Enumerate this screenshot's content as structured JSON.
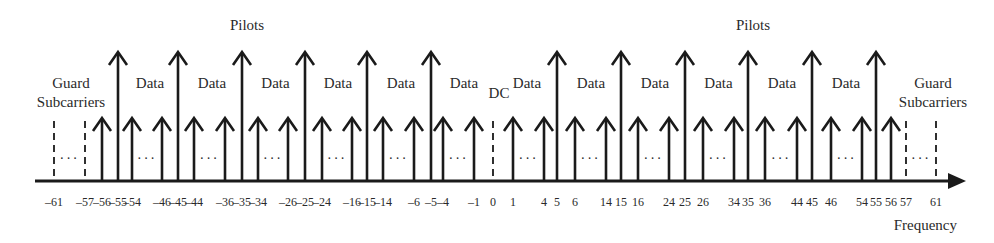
{
  "diagram": {
    "type": "ofdm-subcarrier-allocation",
    "axis_label": "Frequency",
    "labels": {
      "pilots": "Pilots",
      "data": "Data",
      "dc": "DC",
      "guard_line1": "Guard",
      "guard_line2": "Subcarriers",
      "ellipsis": "···"
    },
    "pilot_subcarriers": [
      -55,
      -45,
      -35,
      -25,
      -15,
      -5,
      5,
      15,
      25,
      35,
      45,
      55
    ],
    "data_subcarriers_shown": [
      -56,
      -54,
      -46,
      -44,
      -36,
      -34,
      -26,
      -24,
      -16,
      -14,
      -6,
      -4,
      -1,
      1,
      4,
      6,
      14,
      16,
      24,
      26,
      34,
      36,
      44,
      46,
      54,
      56
    ],
    "dashed_subcarriers": [
      -61,
      -57,
      0,
      57,
      61
    ],
    "tick_labels": [
      {
        "k": -61,
        "text": "–61"
      },
      {
        "k": -57,
        "text": "–57"
      },
      {
        "k": -56,
        "text": "–56"
      },
      {
        "k": -55,
        "text": "–55"
      },
      {
        "k": -54,
        "text": "–54"
      },
      {
        "k": -46,
        "text": "–46"
      },
      {
        "k": -45,
        "text": "–45"
      },
      {
        "k": -44,
        "text": "–44"
      },
      {
        "k": -36,
        "text": "–36"
      },
      {
        "k": -35,
        "text": "–35"
      },
      {
        "k": -34,
        "text": "–34"
      },
      {
        "k": -26,
        "text": "–26"
      },
      {
        "k": -25,
        "text": "–25"
      },
      {
        "k": -24,
        "text": "–24"
      },
      {
        "k": -16,
        "text": "–16"
      },
      {
        "k": -15,
        "text": "–15"
      },
      {
        "k": -14,
        "text": "–14"
      },
      {
        "k": -6,
        "text": "–6"
      },
      {
        "k": -5,
        "text": "–5"
      },
      {
        "k": -4,
        "text": "–4"
      },
      {
        "k": -1,
        "text": "–1"
      },
      {
        "k": 0,
        "text": "0"
      },
      {
        "k": 1,
        "text": "1"
      },
      {
        "k": 4,
        "text": "4"
      },
      {
        "k": 5,
        "text": "5"
      },
      {
        "k": 6,
        "text": "6"
      },
      {
        "k": 14,
        "text": "14"
      },
      {
        "k": 15,
        "text": "15"
      },
      {
        "k": 16,
        "text": "16"
      },
      {
        "k": 24,
        "text": "24"
      },
      {
        "k": 25,
        "text": "25"
      },
      {
        "k": 26,
        "text": "26"
      },
      {
        "k": 34,
        "text": "34"
      },
      {
        "k": 35,
        "text": "35"
      },
      {
        "k": 36,
        "text": "36"
      },
      {
        "k": 44,
        "text": "44"
      },
      {
        "k": 45,
        "text": "45"
      },
      {
        "k": 46,
        "text": "46"
      },
      {
        "k": 54,
        "text": "54"
      },
      {
        "k": 55,
        "text": "55"
      },
      {
        "k": 56,
        "text": "56"
      },
      {
        "k": 57,
        "text": "57"
      },
      {
        "k": 61,
        "text": "61"
      }
    ],
    "ellipsis_gaps": [
      [
        -61,
        -57
      ],
      [
        -54,
        -46
      ],
      [
        -44,
        -36
      ],
      [
        -34,
        -26
      ],
      [
        -24,
        -16
      ],
      [
        -14,
        -6
      ],
      [
        -4,
        -1
      ],
      [
        1,
        4
      ],
      [
        6,
        14
      ],
      [
        16,
        24
      ],
      [
        26,
        34
      ],
      [
        36,
        44
      ],
      [
        46,
        54
      ],
      [
        57,
        61
      ]
    ],
    "data_region_labels_between": [
      [
        -55,
        -45
      ],
      [
        -45,
        -35
      ],
      [
        -35,
        -25
      ],
      [
        -25,
        -15
      ],
      [
        -15,
        -5
      ],
      [
        -5,
        0
      ],
      [
        0,
        5
      ],
      [
        5,
        15
      ],
      [
        15,
        25
      ],
      [
        25,
        35
      ],
      [
        35,
        45
      ],
      [
        45,
        55
      ]
    ],
    "pilots_label_positions": [
      -35,
      35
    ]
  }
}
